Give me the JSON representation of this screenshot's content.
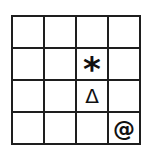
{
  "board": {
    "rows": 4,
    "cols": 4,
    "line_color": "#1e1e1e",
    "background": "#ffffff",
    "cells": [
      [
        "",
        "",
        "",
        ""
      ],
      [
        "",
        "",
        "*",
        ""
      ],
      [
        "",
        "",
        "Δ",
        ""
      ],
      [
        "",
        "",
        "",
        "@"
      ]
    ],
    "pieces": [
      {
        "row": 2,
        "col": 3,
        "symbol": "*",
        "name": "asterisk"
      },
      {
        "row": 3,
        "col": 3,
        "symbol": "Δ",
        "name": "triangle"
      },
      {
        "row": 4,
        "col": 4,
        "symbol": "@",
        "name": "at-sign"
      }
    ]
  }
}
